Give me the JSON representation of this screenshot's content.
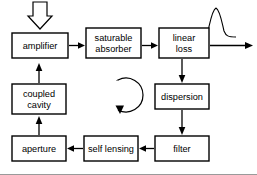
{
  "diagram": {
    "background_color": "#ffffff",
    "line_color": "#000000",
    "boxes": [
      {
        "id": "amplifier",
        "label": "amplifier",
        "lines": [
          "amplifier"
        ],
        "x": 12,
        "y": 33,
        "w": 56,
        "h": 25
      },
      {
        "id": "saturable-absorber",
        "label": "saturable absorber",
        "lines": [
          "saturable",
          "absorber"
        ],
        "x": 86,
        "y": 28,
        "w": 55,
        "h": 30
      },
      {
        "id": "linear-loss",
        "label": "linear loss",
        "lines": [
          "linear",
          "loss"
        ],
        "x": 159,
        "y": 28,
        "w": 50,
        "h": 30
      },
      {
        "id": "dispersion",
        "label": "dispersion",
        "lines": [
          "dispersion"
        ],
        "x": 155,
        "y": 84,
        "w": 54,
        "h": 25
      },
      {
        "id": "filter",
        "label": "filter",
        "lines": [
          "filter"
        ],
        "x": 155,
        "y": 136,
        "w": 54,
        "h": 25
      },
      {
        "id": "self-lensing",
        "label": "self lensing",
        "lines": [
          "self lensing"
        ],
        "x": 84,
        "y": 136,
        "w": 54,
        "h": 25
      },
      {
        "id": "aperture",
        "label": "aperture",
        "lines": [
          "aperture"
        ],
        "x": 12,
        "y": 136,
        "w": 54,
        "h": 25
      },
      {
        "id": "coupled-cavity",
        "label": "coupled cavity",
        "lines": [
          "coupled",
          "cavity"
        ],
        "x": 12,
        "y": 84,
        "w": 54,
        "h": 30
      }
    ],
    "connections": [
      {
        "from": "amplifier",
        "to": "saturable-absorber",
        "direction": "right"
      },
      {
        "from": "saturable-absorber",
        "to": "linear-loss",
        "direction": "right"
      },
      {
        "from": "linear-loss",
        "to": "dispersion",
        "direction": "down"
      },
      {
        "from": "dispersion",
        "to": "filter",
        "direction": "down"
      },
      {
        "from": "filter",
        "to": "self-lensing",
        "direction": "left"
      },
      {
        "from": "self-lensing",
        "to": "aperture",
        "direction": "left"
      },
      {
        "from": "aperture",
        "to": "coupled-cavity",
        "direction": "up"
      },
      {
        "from": "coupled-cavity",
        "to": "amplifier",
        "direction": "up"
      }
    ],
    "annotations": [
      {
        "id": "pump-arrow",
        "type": "hollow-down-arrow",
        "description": "hollow outlined arrow pointing down into amplifier"
      },
      {
        "id": "output-arrow",
        "type": "output-arrow",
        "description": "horizontal arrow exiting linear loss to the right"
      },
      {
        "id": "pulse-waveform",
        "type": "gaussian-pulse",
        "description": "gaussian pulse profile above the output arrow"
      },
      {
        "id": "circulation-loop",
        "type": "clockwise-loop",
        "description": "circular arrow showing clockwise circulation inside the cavity"
      }
    ]
  }
}
